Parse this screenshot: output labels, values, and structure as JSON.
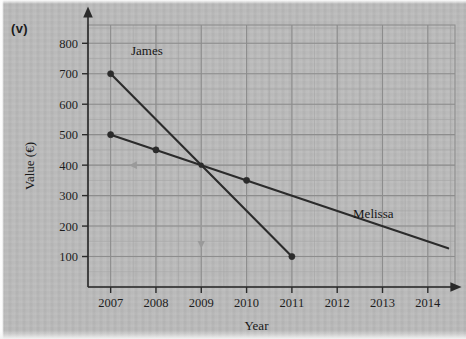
{
  "figure": {
    "part_label": "(v)",
    "background_color": "#b9b9b9",
    "grid_color": "#8d8d8d",
    "grid_minor_color": "#a4a4a4",
    "axis_color": "#2a2a2a",
    "series_color": "#2b2b2b",
    "guide_color": "#9a9a9a"
  },
  "chart_data": {
    "type": "line",
    "title": "",
    "xlabel": "Year",
    "ylabel": "Value (€)",
    "x": [
      2007,
      2008,
      2009,
      2010,
      2011,
      2012,
      2013,
      2014
    ],
    "xlim": [
      2006.5,
      2014.6
    ],
    "ylim": [
      0,
      860
    ],
    "yticks": [
      100,
      200,
      300,
      400,
      500,
      600,
      700,
      800
    ],
    "xticks": [
      2007,
      2008,
      2009,
      2010,
      2011,
      2012,
      2013,
      2014
    ],
    "grid": true,
    "grid_minor": true,
    "legend": "inline-labels",
    "series": [
      {
        "name": "James",
        "label": "James",
        "color": "#2b2b2b",
        "markers": [
          {
            "x": 2007,
            "y": 700
          },
          {
            "x": 2011,
            "y": 100
          }
        ],
        "line": [
          {
            "x": 2007,
            "y": 700
          },
          {
            "x": 2011,
            "y": 100
          }
        ],
        "slope_per_year": -150,
        "label_position": {
          "x": 2007.45,
          "y": 762
        }
      },
      {
        "name": "Melissa",
        "label": "Melissa",
        "color": "#2b2b2b",
        "markers": [
          {
            "x": 2007,
            "y": 500
          },
          {
            "x": 2008,
            "y": 450
          },
          {
            "x": 2010,
            "y": 350
          }
        ],
        "line": [
          {
            "x": 2007,
            "y": 500
          },
          {
            "x": 2014.45,
            "y": 127
          }
        ],
        "slope_per_year": -50,
        "label_position": {
          "x": 2012.35,
          "y": 228
        }
      }
    ],
    "intersection": {
      "x": 2009,
      "y": 400,
      "marked": true
    },
    "guides": [
      {
        "type": "horizontal-arrow",
        "y": 400,
        "from_x": 2009,
        "to_x": 2007.55,
        "direction": "left"
      },
      {
        "type": "vertical-arrow",
        "x": 2009,
        "from_y": 400,
        "to_y": 148,
        "direction": "down"
      }
    ],
    "ytick_labels": [
      "100",
      "200",
      "300",
      "400",
      "500",
      "600",
      "700",
      "800"
    ],
    "xtick_labels": [
      "2007",
      "2008",
      "2009",
      "2010",
      "2011",
      "2012",
      "2013",
      "2014"
    ]
  }
}
